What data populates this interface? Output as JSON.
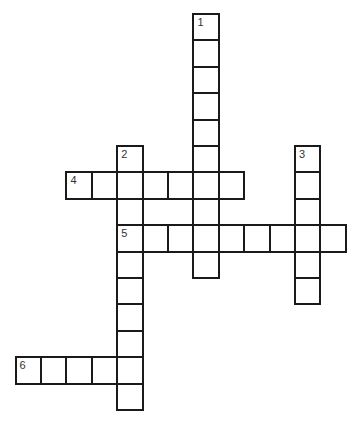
{
  "puzzle": {
    "type": "crossword",
    "grid": {
      "origin_x": 15.6,
      "origin_y": 14,
      "cell_w": 25.4,
      "cell_h": 26.4
    },
    "words": [
      {
        "number": "1",
        "direction": "down",
        "row": 0,
        "col": 7,
        "length": 10
      },
      {
        "number": "2",
        "direction": "down",
        "row": 5,
        "col": 4,
        "length": 10
      },
      {
        "number": "3",
        "direction": "down",
        "row": 5,
        "col": 11,
        "length": 6
      },
      {
        "number": "4",
        "direction": "across",
        "row": 6,
        "col": 2,
        "length": 7
      },
      {
        "number": "5",
        "direction": "across",
        "row": 8,
        "col": 4,
        "length": 9
      },
      {
        "number": "6",
        "direction": "across",
        "row": 13,
        "col": 0,
        "length": 5
      }
    ],
    "colors": {
      "border": "#1a1a1a",
      "cell_bg": "#ffffff",
      "number": "#333333"
    }
  }
}
